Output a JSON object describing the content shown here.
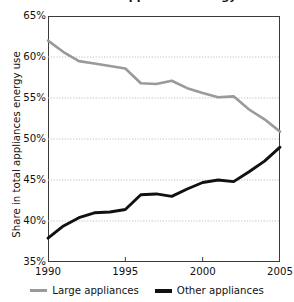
{
  "chart_data": {
    "type": "line",
    "title": "Share in total appliances energy use",
    "xlabel": "",
    "ylabel": "Share in total appliances energy use",
    "x": [
      1990,
      1991,
      1992,
      1993,
      1994,
      1995,
      1996,
      1997,
      1998,
      1999,
      2000,
      2001,
      2002,
      2003,
      2004,
      2005
    ],
    "xlim": [
      1990,
      2005
    ],
    "ylim": [
      35,
      65
    ],
    "y_ticks": [
      35,
      40,
      45,
      50,
      55,
      60,
      65
    ],
    "y_tick_labels": [
      "35%",
      "40%",
      "45%",
      "50%",
      "55%",
      "60%",
      "65%"
    ],
    "x_ticks": [
      1990,
      1995,
      2000,
      2005
    ],
    "x_tick_labels": [
      "1990",
      "1995",
      "2000",
      "2005"
    ],
    "grid": true,
    "grid_style": "dotted-horizontal",
    "legend_position": "bottom",
    "series": [
      {
        "name": "Large appliances",
        "color": "#9a9a9a",
        "width": 2.6,
        "values": [
          62.0,
          60.6,
          59.5,
          59.2,
          58.9,
          58.6,
          56.8,
          56.7,
          57.1,
          56.2,
          55.6,
          55.1,
          55.2,
          53.6,
          52.4,
          50.9
        ]
      },
      {
        "name": "Other appliances",
        "color": "#111111",
        "width": 2.9,
        "values": [
          37.9,
          39.4,
          40.4,
          41.0,
          41.1,
          41.4,
          43.2,
          43.3,
          43.0,
          43.9,
          44.7,
          45.0,
          44.8,
          46.0,
          47.3,
          49.0
        ]
      }
    ]
  },
  "axis": {
    "y_title": "Share in total appliances energy use",
    "y_tick_labels": [
      "65%",
      "60%",
      "55%",
      "50%",
      "45%",
      "40%",
      "35%"
    ],
    "x_tick_labels": [
      "1990",
      "1995",
      "2000",
      "2005"
    ]
  },
  "legend": {
    "items": [
      {
        "label": "Large appliances",
        "color": "#9a9a9a"
      },
      {
        "label": "Other appliances",
        "color": "#111111"
      }
    ]
  },
  "colors": {
    "large_appliances": "#9a9a9a",
    "other_appliances": "#111111",
    "axis": "#3a3a3a",
    "grid": "#b8b8b8",
    "background": "#ffffff"
  }
}
